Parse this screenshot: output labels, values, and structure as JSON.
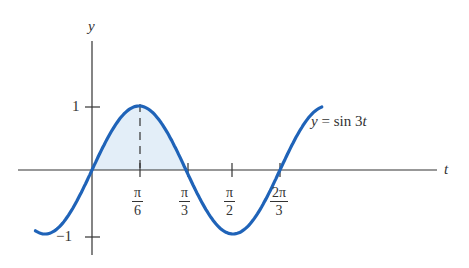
{
  "chart_data": {
    "type": "line",
    "title": "",
    "function": "y = sin 3t",
    "xlabel": "t",
    "ylabel": "y",
    "x_ticks": [
      {
        "num": "π",
        "den": "6",
        "value": 0.5236
      },
      {
        "num": "π",
        "den": "3",
        "value": 1.0472
      },
      {
        "num": "π",
        "den": "2",
        "value": 1.5708
      },
      {
        "num": "2π",
        "den": "3",
        "value": 2.0944
      }
    ],
    "y_ticks": [
      {
        "label": "1",
        "value": 1
      },
      {
        "label": "−1",
        "value": -1
      }
    ],
    "x_range": [
      -0.785,
      2.88
    ],
    "plotted_t_range": [
      -0.63,
      2.56
    ],
    "ylim": [
      -1,
      1
    ],
    "shaded_region": {
      "from": 0,
      "to": 1.0472,
      "description": "area under curve between 0 and π/3"
    },
    "dashed_line_at": 0.5236,
    "curve_label": "y = sin 3t",
    "grid": false,
    "colors": {
      "curve": "#1f63b8",
      "fill": "#e3eef8",
      "axis": "#333333"
    }
  },
  "labels": {
    "y_axis": "y",
    "t_axis": "t",
    "y_tick_1": "1",
    "y_tick_neg1": "−1",
    "curve_eq_y": "y",
    "curve_eq_rest": " = sin 3",
    "curve_eq_t": "t",
    "tick_pi6_num": "π",
    "tick_pi6_den": "6",
    "tick_pi3_num": "π",
    "tick_pi3_den": "3",
    "tick_pi2_num": "π",
    "tick_pi2_den": "2",
    "tick_2pi3_num": "2π",
    "tick_2pi3_den": "3"
  }
}
